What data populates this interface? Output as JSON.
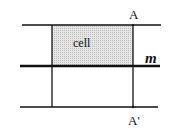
{
  "diagram": {
    "labels": {
      "top_point": "A",
      "bottom_point": "A'",
      "cell": "cell",
      "mirror_line": "m"
    },
    "colors": {
      "line": "#111111",
      "cell_fill": "#d9d9d9",
      "background": "#ffffff"
    },
    "lines": {
      "horizontal": [
        {
          "name": "top",
          "y": 25,
          "x1": 22,
          "x2": 161,
          "thick": false
        },
        {
          "name": "mirror-m",
          "y": 66,
          "x1": 20,
          "x2": 160,
          "thick": true
        },
        {
          "name": "bottom",
          "y": 107,
          "x1": 20,
          "x2": 158,
          "thick": false
        }
      ],
      "vertical": [
        {
          "name": "left",
          "x": 52,
          "y1": 25,
          "y2": 107
        },
        {
          "name": "right",
          "x": 133,
          "y1": 25,
          "y2": 107
        }
      ]
    },
    "shaded_region": {
      "x": 52,
      "y": 25,
      "width": 81,
      "height": 41
    }
  }
}
